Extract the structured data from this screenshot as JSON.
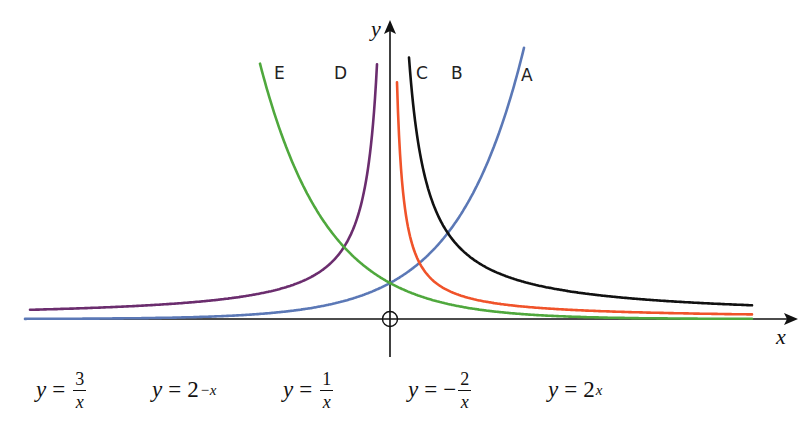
{
  "diagram": {
    "axes": {
      "x_label": "x",
      "y_label": "y",
      "origin_marker": "circle-crosshair"
    },
    "curves": [
      {
        "id": "A",
        "label": "A",
        "color": "#5b78b6",
        "function": "2^x"
      },
      {
        "id": "B",
        "label": "B",
        "color": "#111111",
        "function": "3/x"
      },
      {
        "id": "C",
        "label": "C",
        "color": "#f0532a",
        "function": "1/x"
      },
      {
        "id": "D",
        "label": "D",
        "color": "#6b2d6e",
        "function": "-2/x"
      },
      {
        "id": "E",
        "label": "E",
        "color": "#4fa83d",
        "function": "2^(-x)"
      }
    ],
    "equations": [
      {
        "lhs": "y",
        "eq": "=",
        "sign": "",
        "num": "3",
        "den": "x",
        "type": "fraction"
      },
      {
        "lhs": "y",
        "eq": "=",
        "base": "2",
        "exp": "−x",
        "type": "power"
      },
      {
        "lhs": "y",
        "eq": "=",
        "sign": "",
        "num": "1",
        "den": "x",
        "type": "fraction"
      },
      {
        "lhs": "y",
        "eq": "=",
        "sign": "−",
        "num": "2",
        "den": "x",
        "type": "fraction"
      },
      {
        "lhs": "y",
        "eq": "=",
        "base": "2",
        "exp": "x",
        "type": "power"
      }
    ]
  },
  "chart_data": {
    "type": "line",
    "title": "",
    "xlabel": "x",
    "ylabel": "y",
    "grid": false,
    "legend": "inline labels A–E at top of each curve",
    "xlim": [
      -7.8,
      7.8
    ],
    "ylim": [
      -1,
      8.2
    ],
    "series": [
      {
        "name": "A",
        "equation": "y = 2^x",
        "color": "#5b78b6",
        "x": [
          -7.8,
          -4,
          -2,
          -1,
          0,
          1,
          2,
          2.9
        ],
        "y": [
          0.0045,
          0.0625,
          0.25,
          0.5,
          1,
          2,
          4,
          7.46
        ]
      },
      {
        "name": "B",
        "equation": "y = 3/x",
        "color": "#111111",
        "x": [
          0.38,
          0.5,
          1,
          1.5,
          2,
          4,
          7.8
        ],
        "y": [
          7.9,
          6,
          3,
          2,
          1.5,
          0.75,
          0.38
        ]
      },
      {
        "name": "C",
        "equation": "y = 1/x",
        "color": "#f0532a",
        "x": [
          0.13,
          0.25,
          0.5,
          1,
          2,
          4,
          7.8
        ],
        "y": [
          7.7,
          4,
          2,
          1,
          0.5,
          0.25,
          0.13
        ]
      },
      {
        "name": "D",
        "equation": "y = -2/x",
        "color": "#6b2d6e",
        "x": [
          -7.8,
          -4,
          -2,
          -1,
          -0.5,
          -0.26
        ],
        "y": [
          0.26,
          0.5,
          1,
          2,
          4,
          7.7
        ]
      },
      {
        "name": "E",
        "equation": "y = 2^(-x)",
        "color": "#4fa83d",
        "x": [
          -2.8,
          -2,
          -1,
          0,
          1,
          2,
          4,
          7.8
        ],
        "y": [
          6.96,
          4,
          2,
          1,
          0.5,
          0.25,
          0.0625,
          0.0045
        ]
      }
    ],
    "annotations": [
      "y = 3/x",
      "y = 2^(−x)",
      "y = 1/x",
      "y = −2/x",
      "y = 2^x"
    ]
  }
}
